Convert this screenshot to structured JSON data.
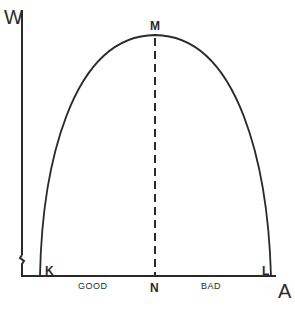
{
  "diagram": {
    "type": "inverted-u-curve",
    "axes": {
      "y_label": "W",
      "x_label": "A"
    },
    "points": {
      "peak": "M",
      "left_root": "K",
      "right_root": "L",
      "peak_foot": "N"
    },
    "regions": {
      "left": "GOOD",
      "right": "BAD"
    },
    "colors": {
      "line": "#2a2a2a",
      "background": "#ffffff"
    }
  }
}
